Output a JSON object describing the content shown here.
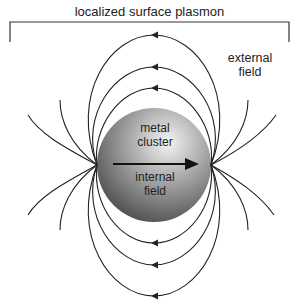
{
  "diagram": {
    "title": "localized surface plasmon",
    "labels": {
      "external": [
        "external",
        "field"
      ],
      "metal": [
        "metal",
        "cluster"
      ],
      "internal": [
        "internal",
        "field"
      ]
    },
    "colors": {
      "line": "#222222",
      "sphere_light": "#f2f2f2",
      "sphere_mid": "#9a9a9a",
      "sphere_dark": "#4a4a4a"
    },
    "elements": [
      "bracket spanning width under title",
      "metal sphere with gradient shading",
      "internal field arrow pointing right",
      "three closed dipole field loops above (arrows leftward)",
      "three closed dipole field loops below (arrows leftward)",
      "open field lines radiating from poles on each side"
    ]
  }
}
